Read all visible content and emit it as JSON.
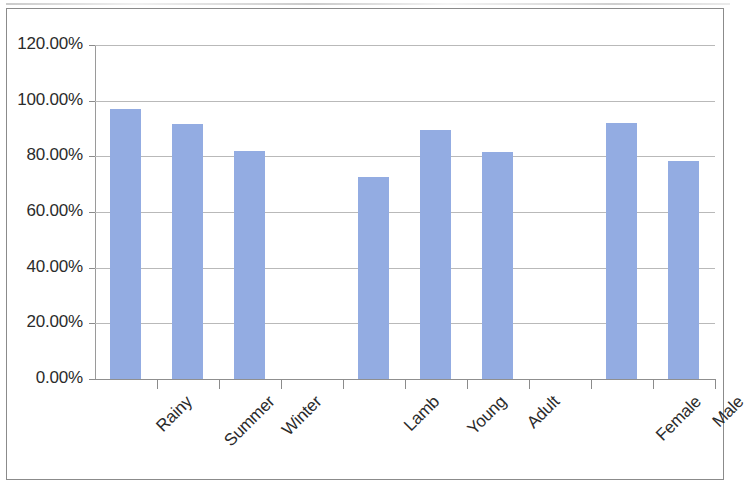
{
  "chart_data": {
    "type": "bar",
    "title": "",
    "subtitle": "",
    "xlabel": "",
    "ylabel": "",
    "categories": [
      "Rainy",
      "Summer",
      "Winter",
      "",
      "Lamb",
      "Young",
      "Adult",
      "",
      "Female",
      "Male"
    ],
    "values": [
      97.0,
      91.5,
      82.0,
      null,
      72.5,
      89.5,
      81.5,
      null,
      92.0,
      78.5
    ],
    "value_format": "percent",
    "ylim": [
      0,
      120
    ],
    "y_ticks": [
      0,
      20,
      40,
      60,
      80,
      100,
      120
    ],
    "y_tick_labels": [
      "0.00%",
      "20.00%",
      "40.00%",
      "60.00%",
      "80.00%",
      "100.00%",
      "120.00%"
    ],
    "grid": true,
    "grid_axis": "y",
    "legend": false,
    "legend_position": "none",
    "bar_color": "#93ace2",
    "gridline_color": "#b9b9b9",
    "axis_color": "#8b8b8b",
    "label_rotation": -45,
    "groups": [
      {
        "name": "Season",
        "categories": [
          "Rainy",
          "Summer",
          "Winter"
        ],
        "values": [
          97.0,
          91.5,
          82.0
        ]
      },
      {
        "name": "Age",
        "categories": [
          "Lamb",
          "Young",
          "Adult"
        ],
        "values": [
          72.5,
          89.5,
          81.5
        ]
      },
      {
        "name": "Sex",
        "categories": [
          "Female",
          "Male"
        ],
        "values": [
          92.0,
          78.5
        ]
      }
    ]
  }
}
